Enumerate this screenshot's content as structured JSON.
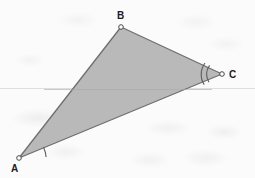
{
  "figure": {
    "kind": "triangle-geometry-figure",
    "background_color": "#fbfbfb",
    "fill_color": "#b9b9b9",
    "stroke_color": "#6f6f6f",
    "baseline_color": "#dedede",
    "label_color": "#1c1c1c",
    "vertex_marker_fill": "#ffffff",
    "vertices": [
      {
        "label": "A",
        "x": 19,
        "y": 158,
        "label_x": 11,
        "label_y": 164,
        "angle_marks": 1
      },
      {
        "label": "B",
        "x": 121,
        "y": 27,
        "label_x": 117,
        "label_y": 11,
        "angle_marks": 0
      },
      {
        "label": "C",
        "x": 222,
        "y": 74,
        "label_x": 229,
        "label_y": 70,
        "angle_marks": 2
      }
    ],
    "baseline": {
      "y": 88.5,
      "x_start": 0,
      "x_end": 255
    },
    "median": {
      "from": "A_side_midpoint",
      "x1": 43,
      "y1": 91,
      "x2": 213,
      "y2": 91
    }
  }
}
